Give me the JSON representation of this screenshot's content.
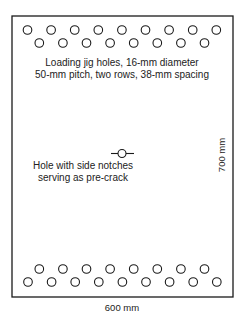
{
  "diagram": {
    "type": "specimen-drawing",
    "plate": {
      "width_label": "600 mm",
      "height_label": "700 mm"
    },
    "jig_holes_note": {
      "line1": "Loading jig holes, 16-mm diameter",
      "line2": "50-mm pitch, two rows, 38-mm spacing"
    },
    "center_hole_note": {
      "line1": "Hole with side notches",
      "line2": "serving as pre-crack"
    },
    "hole_rows": {
      "top_outer_count": 9,
      "top_inner_count": 8,
      "bottom_inner_count": 8,
      "bottom_outer_count": 9
    },
    "colors": {
      "stroke": "#1a1a1a",
      "background": "#ffffff"
    }
  }
}
